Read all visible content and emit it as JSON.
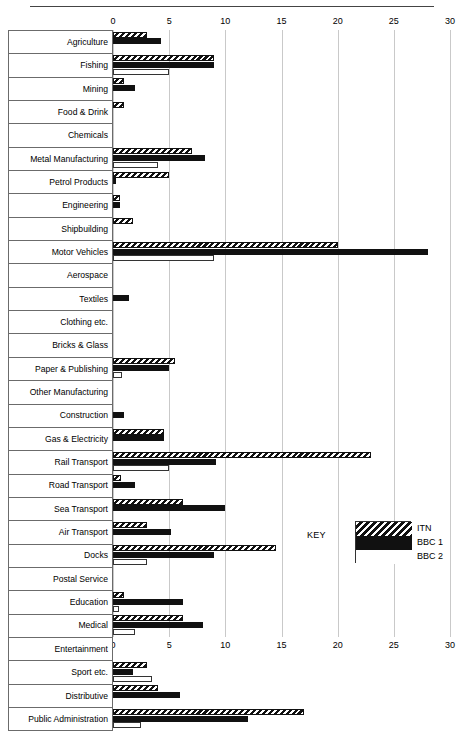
{
  "chart_data": {
    "type": "bar",
    "orientation": "horizontal",
    "title": "",
    "xlabel": "",
    "ylabel": "",
    "xlim": [
      0,
      30
    ],
    "xticks": [
      0,
      5,
      10,
      15,
      20,
      25,
      30
    ],
    "xtick_labels": [
      "0",
      "5",
      "10",
      "15",
      "20",
      "25",
      "30"
    ],
    "grid": true,
    "legend_position": "bottom-right",
    "legend_title": "KEY",
    "categories": [
      "Agriculture",
      "Fishing",
      "Mining",
      "Food & Drink",
      "Chemicals",
      "Metal Manufacturing",
      "Petrol Products",
      "Engineering",
      "Shipbuilding",
      "Motor Vehicles",
      "Aerospace",
      "Textiles",
      "Clothing etc.",
      "Bricks & Glass",
      "Paper & Publishing",
      "Other Manufacturing",
      "Construction",
      "Gas & Electricity",
      "Rail Transport",
      "Road Transport",
      "Sea Transport",
      "Air Transport",
      "Docks",
      "Postal Service",
      "Education",
      "Medical",
      "Entertainment",
      "Sport etc.",
      "Distributive",
      "Public Administration"
    ],
    "series": [
      {
        "name": "ITN",
        "style": "hatched",
        "color": "#111111",
        "values": [
          3,
          9,
          1,
          1,
          0,
          7,
          5,
          0.6,
          1.8,
          20,
          0,
          0,
          0,
          0,
          5.5,
          0,
          0,
          4.5,
          23,
          0.7,
          6.2,
          3,
          14.5,
          0,
          1,
          6.2,
          0,
          3,
          4,
          17
        ]
      },
      {
        "name": "BBC 1",
        "style": "solid",
        "color": "#111111",
        "values": [
          4.3,
          9,
          2,
          0,
          0,
          8.2,
          0.3,
          0.6,
          0,
          28,
          0,
          1.4,
          0,
          0,
          5,
          0,
          1,
          4.5,
          9.2,
          2,
          10,
          5.2,
          9,
          0,
          6.2,
          8,
          0,
          1.8,
          6,
          12
        ]
      },
      {
        "name": "BBC 2",
        "style": "outline",
        "color": "#ffffff",
        "values": [
          0,
          5,
          0,
          0,
          0,
          4,
          0,
          0,
          0,
          9,
          0,
          0,
          0,
          0,
          0.8,
          0,
          0,
          0,
          5,
          0,
          0,
          0,
          3,
          0,
          0.5,
          2,
          0,
          3.5,
          0,
          2.5
        ]
      }
    ]
  },
  "legend": {
    "key_label": "KEY",
    "entries": [
      "ITN",
      "BBC 1",
      "BBC 2"
    ]
  }
}
